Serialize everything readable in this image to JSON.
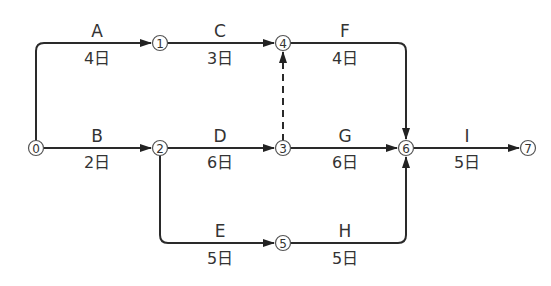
{
  "diagram": {
    "type": "arrow-diagram-network",
    "nodes": [
      {
        "id": "0",
        "label": "0",
        "x": 36,
        "y": 148
      },
      {
        "id": "1",
        "label": "1",
        "x": 160,
        "y": 43
      },
      {
        "id": "2",
        "label": "2",
        "x": 160,
        "y": 148
      },
      {
        "id": "3",
        "label": "3",
        "x": 283,
        "y": 148
      },
      {
        "id": "4",
        "label": "4",
        "x": 283,
        "y": 43
      },
      {
        "id": "5",
        "label": "5",
        "x": 283,
        "y": 243
      },
      {
        "id": "6",
        "label": "6",
        "x": 406,
        "y": 148
      },
      {
        "id": "7",
        "label": "7",
        "x": 528,
        "y": 148
      }
    ],
    "activities": [
      {
        "name": "A",
        "duration": "4日",
        "from": "0",
        "to": "1"
      },
      {
        "name": "B",
        "duration": "2日",
        "from": "0",
        "to": "2"
      },
      {
        "name": "C",
        "duration": "3日",
        "from": "1",
        "to": "4"
      },
      {
        "name": "D",
        "duration": "6日",
        "from": "2",
        "to": "3"
      },
      {
        "name": "E",
        "duration": "5日",
        "from": "2",
        "to": "5"
      },
      {
        "name": "F",
        "duration": "4日",
        "from": "4",
        "to": "6"
      },
      {
        "name": "G",
        "duration": "6日",
        "from": "3",
        "to": "6"
      },
      {
        "name": "H",
        "duration": "5日",
        "from": "5",
        "to": "6"
      },
      {
        "name": "I",
        "duration": "5日",
        "from": "6",
        "to": "7"
      }
    ],
    "dummy_activities": [
      {
        "from": "3",
        "to": "4",
        "style": "dashed"
      }
    ],
    "colors": {
      "line": "#2a2a2a",
      "text": "#333333",
      "node_stroke": "#555555"
    }
  }
}
